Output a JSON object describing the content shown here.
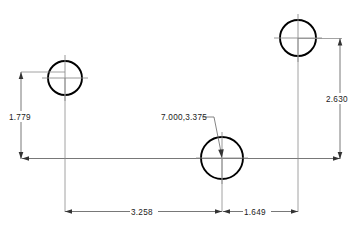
{
  "drawing": {
    "type": "engineering-dimension-drawing",
    "background_color": "#ffffff",
    "line_color": "#000000",
    "dimension_color": "#555555",
    "text_color": "#1a1a1a",
    "features": [
      {
        "name": "left-hole",
        "cx": 65,
        "cy": 78,
        "r": 17
      },
      {
        "name": "middle-hole",
        "cx": 222,
        "cy": 158,
        "r": 21
      },
      {
        "name": "right-hole",
        "cx": 298,
        "cy": 38,
        "r": 18
      }
    ],
    "dimensions": {
      "vertical_left": "1.779",
      "vertical_right": "2.630",
      "horizontal_left": "3.258",
      "horizontal_right": "1.649"
    },
    "annotations": {
      "coordinate_label": "7.000,3.375"
    }
  }
}
